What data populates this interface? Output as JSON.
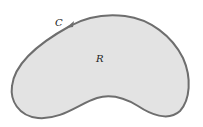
{
  "diagram": {
    "curve_label": "C",
    "region_label": "R",
    "fill_color": "#e3e3e3",
    "stroke_color": "#6e6e6e",
    "arrow": "arrow-icon"
  }
}
